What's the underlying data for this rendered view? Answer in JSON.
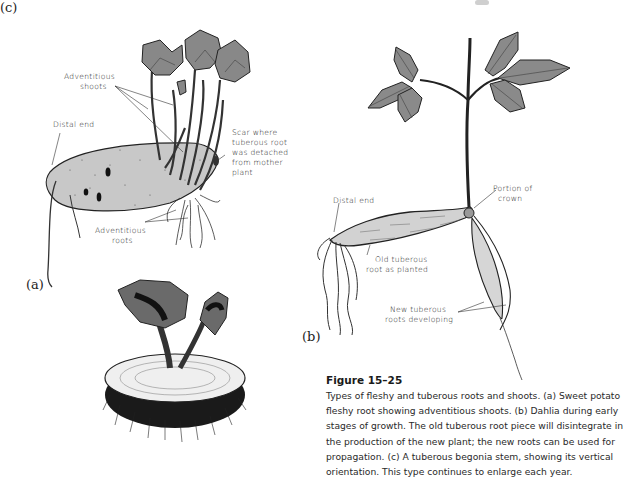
{
  "figure": {
    "number": "Figure 15–25",
    "caption": "Types of fleshy and tuberous roots and shoots. (a) Sweet potato fleshy root showing adventitious shoots. (b) Dahlia during early stages of growth. The old tuberous root piece will disintegrate in the production of the new plant; the new roots can be used for propagation. (c) A tuberous begonia stem, showing its vertical orientation. This type continues to enlarge each year."
  },
  "panel_a": {
    "letter": "(a)",
    "subject": "Sweet potato fleshy root",
    "labels": {
      "adventitious_shoots_1": "Adventitious",
      "adventitious_shoots_2": "shoots",
      "distal_end": "Distal end",
      "scar_1": "Scar where",
      "scar_2": "tuberous root",
      "scar_3": "was detached",
      "scar_4": "from mother",
      "scar_5": "plant",
      "adventitious_roots_1": "Adventitious",
      "adventitious_roots_2": "roots"
    }
  },
  "panel_b": {
    "letter": "(b)",
    "subject": "Dahlia",
    "labels": {
      "distal_end": "Distal end",
      "portion_of_crown_1": "Portion of",
      "portion_of_crown_2": "crown",
      "old_root_1": "Old tuberous",
      "old_root_2": "root as planted",
      "new_roots_1": "New tuberous",
      "new_roots_2": "roots developing"
    }
  },
  "panel_c": {
    "letter": "(c)",
    "subject": "Tuberous begonia stem"
  }
}
